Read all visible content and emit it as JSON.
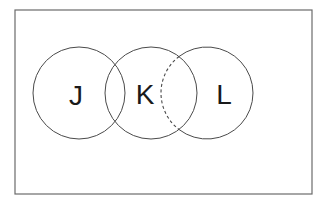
{
  "diagram": {
    "type": "venn",
    "universe": {
      "x": 15,
      "y": 10,
      "width": 297,
      "height": 184,
      "stroke": "#6b6b6b"
    },
    "sets": [
      {
        "label": "J",
        "cx": 79,
        "cy": 93,
        "r": 46,
        "label_x": 76,
        "label_y": 105
      },
      {
        "label": "K",
        "cx": 151,
        "cy": 93,
        "r": 46,
        "label_x": 145,
        "label_y": 104
      },
      {
        "label": "L",
        "cx": 207,
        "cy": 93,
        "r": 46,
        "label_x": 224,
        "label_y": 104
      }
    ],
    "hidden_arc": {
      "description": "dashed portion of L inside K",
      "from_set": "L",
      "style": "dashed"
    },
    "colors": {
      "stroke": "#4a4a4a",
      "label": "#1a1a1a",
      "background": "#ffffff"
    }
  }
}
